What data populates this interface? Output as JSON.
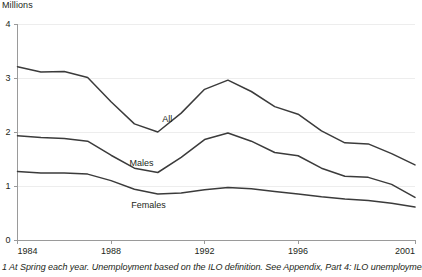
{
  "figure": {
    "unit_label": "Millions",
    "footnote": "1 At Spring each year. Unemployment based on the ILO definition. See Appendix, Part 4: ILO unemployment.",
    "axis_color": "#9a9a9a",
    "grid_color": "#ededed",
    "line_color": "#3b3b3b",
    "text_color": "#231f20"
  },
  "chart_data": {
    "type": "line",
    "title": "",
    "subtitle": "",
    "xlabel": "",
    "ylabel": "Millions",
    "xlim": [
      1984,
      2001
    ],
    "ylim": [
      0,
      4
    ],
    "yticks": [
      0,
      1,
      2,
      3,
      4
    ],
    "ytick_labels": [
      "0",
      "1",
      "2",
      "3",
      "4"
    ],
    "xticks": [
      1984,
      1988,
      1992,
      1996,
      2001
    ],
    "xtick_labels": [
      "1984",
      "1988",
      "1992",
      "1996",
      "2001"
    ],
    "grid": "horizontal",
    "legend": "inline-labels",
    "x": [
      1984,
      1985,
      1986,
      1987,
      1988,
      1989,
      1990,
      1991,
      1992,
      1993,
      1994,
      1995,
      1996,
      1997,
      1998,
      1999,
      2000,
      2001
    ],
    "series": [
      {
        "name": "All",
        "label": "All",
        "label_x": 1990.4,
        "label_y": 2.18,
        "values": [
          3.21,
          3.11,
          3.12,
          3.01,
          2.56,
          2.15,
          2.0,
          2.35,
          2.79,
          2.96,
          2.75,
          2.47,
          2.33,
          2.02,
          1.8,
          1.78,
          1.6,
          1.39
        ]
      },
      {
        "name": "Males",
        "label": "Males",
        "label_x": 1989.3,
        "label_y": 1.37,
        "values": [
          1.93,
          1.9,
          1.88,
          1.83,
          1.57,
          1.33,
          1.25,
          1.53,
          1.86,
          1.98,
          1.83,
          1.62,
          1.56,
          1.33,
          1.18,
          1.16,
          1.03,
          0.79
        ]
      },
      {
        "name": "Females",
        "label": "Females",
        "label_x": 1989.6,
        "label_y": 0.6,
        "values": [
          1.27,
          1.24,
          1.24,
          1.22,
          1.1,
          0.94,
          0.85,
          0.87,
          0.93,
          0.97,
          0.95,
          0.9,
          0.85,
          0.8,
          0.76,
          0.73,
          0.68,
          0.61
        ]
      }
    ]
  }
}
